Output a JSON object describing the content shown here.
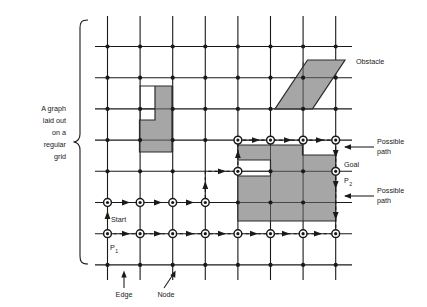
{
  "figure": {
    "title": "A graph laid out on a regular grid",
    "colors": {
      "line": "#1a1a1a",
      "obstacle_fill": "#a6a6a6",
      "obstacle_stroke": "#2b2b2b",
      "background": "#ffffff",
      "path": "#1a1a1a"
    },
    "grid": {
      "columns": 8,
      "rows": 8,
      "x0": 107.5,
      "y0": 46.5,
      "dx": 32.6,
      "dy": 31.2,
      "overhang": 12
    }
  },
  "labels": {
    "left_bracket": {
      "lines": [
        "A graph",
        "laid out",
        "on  a",
        "regular",
        "grid"
      ],
      "align": "right"
    },
    "obstacle": "Obstacle",
    "possible_path_top": [
      "Possible",
      "path"
    ],
    "possible_path_bottom": [
      "Possible",
      "path"
    ],
    "goal": "Goal",
    "p2_main": "P",
    "p2_sub": "2",
    "p1_main": "P",
    "p1_sub": "1",
    "start": "Start",
    "edge": "Edge",
    "node": "Node"
  },
  "obstacles": [
    {
      "name": "l-shaped-obstacle",
      "points": "139.5,86 172,86 172,152 139.5,152 139.5,120 155,120 155,86"
    },
    {
      "name": "parallelogram-obstacle",
      "points": "275,108.5 307.5,60 345,60 312.5,108.5"
    },
    {
      "name": "block-obstacle",
      "points": "237.5,145 302.5,145 302.5,155 335,155 335,221 237.5,221 237.5,176 270,176 270,160 237.5,160"
    }
  ],
  "paths": [
    {
      "name": "lower-path-p1",
      "description": "Path along the bottom row from P1 to the right, then up",
      "d": "M 107.5,233.5 L 335,233.5 L 335,140"
    },
    {
      "name": "upper-path-start",
      "description": "Path from Start up through the middle and across the top",
      "d": "M 107.5,202 L 205,202 L 205,170 L 237.5,170 L 237.5,140 L 335,140"
    }
  ],
  "marked_nodes": [
    [
      0,
      5
    ],
    [
      1,
      5
    ],
    [
      2,
      5
    ],
    [
      3,
      5
    ],
    [
      0,
      6
    ],
    [
      1,
      6
    ],
    [
      2,
      6
    ],
    [
      3,
      6
    ],
    [
      4,
      6
    ],
    [
      5,
      6
    ],
    [
      6,
      6
    ],
    [
      7,
      6
    ],
    [
      4,
      4
    ],
    [
      4,
      3
    ],
    [
      5,
      3
    ],
    [
      6,
      3
    ],
    [
      7,
      3
    ],
    [
      7,
      4
    ],
    [
      7,
      5
    ]
  ]
}
